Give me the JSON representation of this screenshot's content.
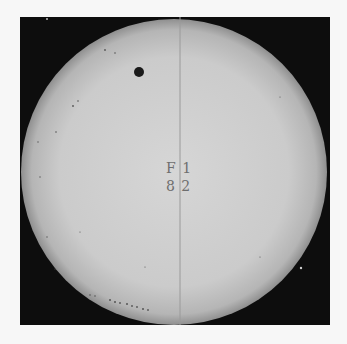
{
  "image": {
    "subject": "Photograph of the solar disc with a small dark circular body in transit",
    "plate_label": {
      "line1": "F  1",
      "line2": "8  2"
    },
    "colors": {
      "background": "#0d0d0d",
      "disc_center": "#d4d4d4",
      "disc_edge": "#a8a8a8",
      "transit_body": "#1a1a1a",
      "page": "#f7f7f7"
    }
  }
}
